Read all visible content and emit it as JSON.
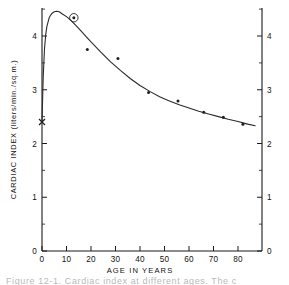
{
  "figure": {
    "caption_partial": "Figure 12-1.  Cardiac index at different ages.  The c"
  },
  "chart_data": {
    "type": "line",
    "title": "",
    "xlabel": "AGE IN YEARS",
    "ylabel": "CARDIAC INDEX  (liters/min./sq.m.)",
    "xlim": [
      0,
      87
    ],
    "ylim": [
      0,
      4.6
    ],
    "grid": false,
    "legend": "none",
    "x_ticks": [
      0,
      10,
      20,
      30,
      40,
      50,
      60,
      70,
      80
    ],
    "x_tick_labels": [
      "0",
      "10",
      "20",
      "30",
      "40",
      "50",
      "60",
      "70",
      "80"
    ],
    "y_ticks": [
      0,
      1,
      2,
      3,
      4
    ],
    "y_tick_labels": [
      "0",
      "1",
      "2",
      "3",
      "4"
    ],
    "y_minor_ticks": [
      0.5,
      1.5,
      2.5,
      3.5,
      4.5
    ],
    "right_axis_ticks": [
      0,
      1,
      2,
      3,
      4
    ],
    "right_axis_tick_labels": [
      "0",
      "1",
      "2",
      "3",
      "4"
    ],
    "series": [
      {
        "name": "fitted curve",
        "type": "line",
        "x": [
          0,
          0.5,
          1,
          1.5,
          2,
          3,
          4,
          5,
          6,
          7,
          8,
          10,
          12,
          14,
          16,
          18,
          20,
          24,
          28,
          32,
          36,
          40,
          44,
          48,
          52,
          56,
          60,
          64,
          68,
          72,
          76,
          80,
          84,
          87
        ],
        "y": [
          2.4,
          3.25,
          3.75,
          4.02,
          4.18,
          4.35,
          4.42,
          4.45,
          4.46,
          4.45,
          4.42,
          4.36,
          4.28,
          4.19,
          4.09,
          3.99,
          3.89,
          3.7,
          3.52,
          3.36,
          3.21,
          3.08,
          2.97,
          2.87,
          2.79,
          2.72,
          2.66,
          2.6,
          2.55,
          2.5,
          2.45,
          2.41,
          2.36,
          2.33
        ]
      },
      {
        "name": "observed points",
        "type": "scatter",
        "points": [
          {
            "x": 13,
            "y": 4.34,
            "circled": true
          },
          {
            "x": 18.5,
            "y": 3.75,
            "circled": false
          },
          {
            "x": 31,
            "y": 3.58,
            "circled": false
          },
          {
            "x": 43.5,
            "y": 2.95,
            "circled": false
          },
          {
            "x": 55.5,
            "y": 2.79,
            "circled": false
          },
          {
            "x": 66,
            "y": 2.58,
            "circled": false
          },
          {
            "x": 74,
            "y": 2.49,
            "circled": false
          },
          {
            "x": 82,
            "y": 2.36,
            "circled": false
          }
        ]
      },
      {
        "name": "birth marker",
        "type": "marker",
        "marker": "x",
        "points": [
          {
            "x": 0,
            "y": 2.4
          }
        ]
      }
    ]
  }
}
